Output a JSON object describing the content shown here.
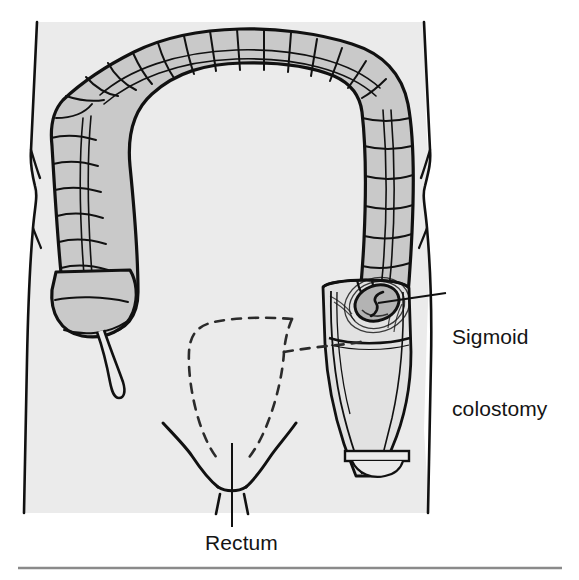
{
  "figure": {
    "canvas": {
      "width": 579,
      "height": 580
    },
    "colors": {
      "page_background": "#ffffff",
      "body_fill": "#ebebeb",
      "colon_fill": "#c9c9c9",
      "stoma_fill": "#b3b3b3",
      "bag_fill": "#e2e2e2",
      "ink": "#111111",
      "rule": "#8a8a8a",
      "dashed_ink": "#2b2b2b"
    }
  },
  "labels": {
    "sigmoid_colostomy": "Sigmoid\ncolostomy",
    "sigmoid_colostomy_line1": "Sigmoid",
    "sigmoid_colostomy_line2": "colostomy",
    "rectum": "Rectum"
  },
  "anatomy": {
    "items": [
      {
        "name": "torso-outline",
        "description": "Abdominal body outline with waist indentation"
      },
      {
        "name": "ascending-colon",
        "description": "Haustrated ascending colon on the left side"
      },
      {
        "name": "cecum",
        "description": "Cecum at lower end of ascending colon"
      },
      {
        "name": "appendix",
        "description": "Vermiform appendix hanging from cecum"
      },
      {
        "name": "transverse-colon",
        "description": "Haustrated transverse colon arching across the top"
      },
      {
        "name": "descending-colon",
        "description": "Haustrated descending colon on the right side"
      },
      {
        "name": "stoma",
        "description": "Sigmoid colostomy stoma opening on the abdominal wall"
      },
      {
        "name": "colostomy-bag",
        "description": "Drainable ostomy pouch with clamped outlet"
      },
      {
        "name": "removed-rectum-dashed",
        "description": "Dashed outline indicating resected rectosigmoid"
      },
      {
        "name": "groin-creases",
        "description": "Inguinal creases forming a V at the perineum"
      },
      {
        "name": "rectum-leader",
        "description": "Leader line from perineum down to Rectum label"
      },
      {
        "name": "stoma-leader",
        "description": "Leader line from stoma to Sigmoid colostomy label"
      },
      {
        "name": "bottom-rule",
        "description": "Horizontal divider rule under the figure"
      }
    ]
  }
}
